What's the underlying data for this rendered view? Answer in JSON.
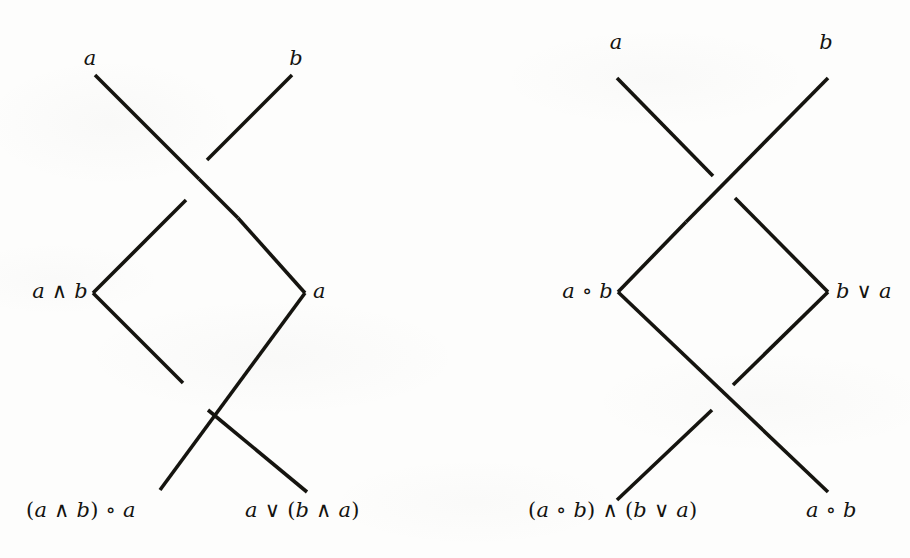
{
  "figure": {
    "type": "knot-crossing-diagrams",
    "background_color": "#fdfdfc",
    "stroke_color": "#15140f",
    "panel_count": 2
  },
  "diagrams": [
    {
      "id": "left-diagram",
      "name": "lattice-crossing-diagram-left",
      "labels": {
        "top_left": "a",
        "top_right": "b",
        "mid_left": "a ∧ b",
        "mid_right": "a",
        "bottom_left": "(a ∧ b) ∘ a",
        "bottom_right": "a ∨ (b ∧ a)"
      },
      "crossings": [
        {
          "position": "top",
          "over_strand": "nw-se",
          "under_strand": "sw-ne"
        },
        {
          "position": "bottom",
          "over_strand": "sw-ne",
          "under_strand": "nw-se"
        }
      ]
    },
    {
      "id": "right-diagram",
      "name": "lattice-crossing-diagram-right",
      "labels": {
        "top_left": "a",
        "top_right": "b",
        "mid_left": "a ∘ b",
        "mid_right": "b ∨ a",
        "bottom_left": "(a ∘ b) ∧ (b ∨ a)",
        "bottom_right": "a ∘ b"
      },
      "crossings": [
        {
          "position": "top",
          "over_strand": "sw-ne",
          "under_strand": "nw-se"
        },
        {
          "position": "bottom",
          "over_strand": "nw-se",
          "under_strand": "sw-ne"
        }
      ]
    }
  ],
  "operators": {
    "meet": "∧",
    "join": "∨",
    "compose": "∘"
  }
}
